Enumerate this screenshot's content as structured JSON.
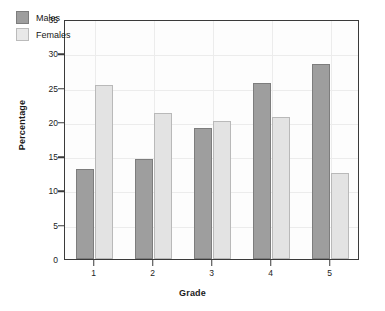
{
  "chart_data": {
    "type": "bar",
    "title": "",
    "xlabel": "Grade",
    "ylabel": "Percentage",
    "categories": [
      "1",
      "2",
      "3",
      "4",
      "5"
    ],
    "series": [
      {
        "name": "Males",
        "color": "#9e9e9e",
        "values": [
          13.1,
          14.6,
          19.1,
          25.6,
          28.5
        ]
      },
      {
        "name": "Females",
        "color": "#e3e3e3",
        "values": [
          25.4,
          21.3,
          20.1,
          20.7,
          12.6
        ]
      }
    ],
    "ylim": [
      0,
      35
    ],
    "yticks": [
      "0",
      "5",
      "10",
      "15",
      "20",
      "25",
      "30",
      "35"
    ],
    "grid": true,
    "legend_position": "top-left"
  },
  "legend": {
    "items": [
      {
        "label": "Males"
      },
      {
        "label": "Females"
      }
    ]
  }
}
